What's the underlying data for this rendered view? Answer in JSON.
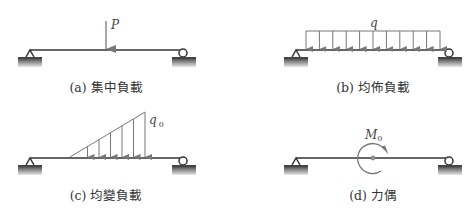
{
  "panels": [
    {
      "id": "a",
      "caption": "(a) 集中負載",
      "load_type": "concentrated",
      "load_label": "P"
    },
    {
      "id": "b",
      "caption": "(b) 均佈負載",
      "load_type": "uniform",
      "load_label": "q"
    },
    {
      "id": "c",
      "caption": "(c) 均變負載",
      "load_type": "linearly-varying",
      "load_label": "q",
      "load_label_sub": "0"
    },
    {
      "id": "d",
      "caption": "(d) 力偶",
      "load_type": "couple",
      "load_label": "M",
      "load_label_sub": "0"
    }
  ],
  "colors": {
    "beam": "#333333",
    "load": "#777777",
    "ground_top": "#444444",
    "ground_bottom": "#e0e0e0"
  }
}
